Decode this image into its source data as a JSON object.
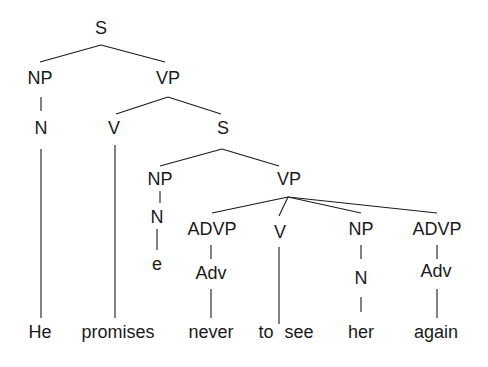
{
  "diagram": {
    "type": "syntax-tree",
    "sentence": "He promises never to see her again",
    "nodes": {
      "s_root": "S",
      "np_subj": "NP",
      "vp_main": "VP",
      "n_subj": "N",
      "v_main": "V",
      "s_embedded": "S",
      "np_embedded": "NP",
      "vp_embedded": "VP",
      "n_embedded": "N",
      "empty": "e",
      "advp_1": "ADVP",
      "v_embedded": "V",
      "np_obj": "NP",
      "advp_2": "ADVP",
      "adv_1": "Adv",
      "n_obj": "N",
      "adv_2": "Adv"
    },
    "words": {
      "he": "He",
      "promises": "promises",
      "never": "never",
      "to": "to",
      "see": "see",
      "her": "her",
      "again": "again"
    }
  }
}
